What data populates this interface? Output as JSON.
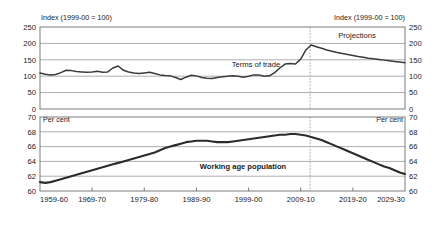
{
  "figure": {
    "background": "#ffffff",
    "line_color": "#3a3a3a",
    "grid_color": "#8c8c8c",
    "projection_divider_color": "#9a9a9a"
  },
  "chart_data": [
    {
      "type": "line",
      "id": "terms-of-trade",
      "title": "",
      "xlabel": "",
      "ylabel": "Index (1999-00 = 100)",
      "ylabel_right": "Index (1999-00 = 100)",
      "ylim": [
        0,
        250
      ],
      "yticks": [
        0,
        50,
        100,
        150,
        200,
        250
      ],
      "ytick_labels": [
        "0",
        "50",
        "100",
        "150",
        "200",
        "250"
      ],
      "xlim": [
        1959,
        2029
      ],
      "grid": true,
      "legend": "none",
      "annotations": [
        {
          "text": "Terms of trade",
          "x": 1993,
          "y": 128
        },
        {
          "text": "Projections",
          "x": 2019,
          "y": 222
        }
      ],
      "projection_start": 2011,
      "series": [
        {
          "name": "Terms of trade",
          "x": [
            1959,
            1960,
            1961,
            1962,
            1963,
            1964,
            1965,
            1966,
            1967,
            1968,
            1969,
            1970,
            1971,
            1972,
            1973,
            1974,
            1975,
            1976,
            1977,
            1978,
            1979,
            1980,
            1981,
            1982,
            1983,
            1984,
            1985,
            1986,
            1987,
            1988,
            1989,
            1990,
            1991,
            1992,
            1993,
            1994,
            1995,
            1996,
            1997,
            1998,
            1999,
            2000,
            2001,
            2002,
            2003,
            2004,
            2005,
            2006,
            2007,
            2008,
            2009,
            2010,
            2011,
            2012,
            2013,
            2014,
            2015,
            2016,
            2017,
            2018,
            2019,
            2020,
            2021,
            2022,
            2023,
            2024,
            2025,
            2026,
            2027,
            2028,
            2029
          ],
          "values": [
            110,
            106,
            104,
            105,
            111,
            118,
            117,
            114,
            113,
            112,
            113,
            115,
            112,
            113,
            125,
            131,
            118,
            113,
            110,
            108,
            110,
            112,
            108,
            104,
            102,
            101,
            96,
            90,
            97,
            103,
            101,
            96,
            94,
            93,
            96,
            98,
            100,
            101,
            100,
            97,
            100,
            104,
            104,
            100,
            101,
            111,
            125,
            137,
            139,
            137,
            152,
            180,
            195,
            190,
            185,
            180,
            176,
            172,
            169,
            166,
            163,
            160,
            158,
            155,
            153,
            151,
            149,
            147,
            145,
            143,
            141
          ]
        }
      ]
    },
    {
      "type": "line",
      "id": "working-age-population",
      "title": "",
      "xlabel": "",
      "ylabel": "Per cent",
      "ylabel_right": "Per cent",
      "ylim": [
        60,
        70
      ],
      "yticks": [
        60,
        62,
        64,
        66,
        68,
        70
      ],
      "ytick_labels": [
        "60",
        "62",
        "64",
        "66",
        "68",
        "70"
      ],
      "xlim": [
        1959,
        2029
      ],
      "xticks": [
        1959,
        1969,
        1979,
        1989,
        1999,
        2009,
        2019,
        2029
      ],
      "xtick_labels": [
        "1959-60",
        "1969-70",
        "1979-80",
        "1989-90",
        "1999-00",
        "2009-10",
        "2019-20",
        "2029-30"
      ],
      "grid": true,
      "legend": "none",
      "annotations": [
        {
          "text": "Working age population",
          "x": 1998,
          "y": 65.1,
          "bold": true
        }
      ],
      "projection_start": 2011,
      "series": [
        {
          "name": "Working age population",
          "x": [
            1959,
            1960,
            1961,
            1962,
            1963,
            1964,
            1965,
            1966,
            1967,
            1968,
            1969,
            1970,
            1971,
            1972,
            1973,
            1974,
            1975,
            1976,
            1977,
            1978,
            1979,
            1980,
            1981,
            1982,
            1983,
            1984,
            1985,
            1986,
            1987,
            1988,
            1989,
            1990,
            1991,
            1992,
            1993,
            1994,
            1995,
            1996,
            1997,
            1998,
            1999,
            2000,
            2001,
            2002,
            2003,
            2004,
            2005,
            2006,
            2007,
            2008,
            2009,
            2010,
            2011,
            2012,
            2013,
            2014,
            2015,
            2016,
            2017,
            2018,
            2019,
            2020,
            2021,
            2022,
            2023,
            2024,
            2025,
            2026,
            2027,
            2028,
            2029
          ],
          "values": [
            61.2,
            61.1,
            61.2,
            61.4,
            61.6,
            61.8,
            62.0,
            62.2,
            62.4,
            62.6,
            62.8,
            63.0,
            63.2,
            63.4,
            63.6,
            63.8,
            64.0,
            64.2,
            64.4,
            64.6,
            64.8,
            65.0,
            65.2,
            65.5,
            65.8,
            66.0,
            66.2,
            66.4,
            66.6,
            66.7,
            66.8,
            66.8,
            66.8,
            66.7,
            66.6,
            66.6,
            66.6,
            66.7,
            66.8,
            66.9,
            67.0,
            67.1,
            67.2,
            67.3,
            67.4,
            67.5,
            67.6,
            67.6,
            67.7,
            67.7,
            67.6,
            67.5,
            67.3,
            67.1,
            66.9,
            66.6,
            66.3,
            66.0,
            65.7,
            65.4,
            65.1,
            64.8,
            64.5,
            64.2,
            63.9,
            63.6,
            63.3,
            63.1,
            62.8,
            62.5,
            62.3
          ]
        }
      ]
    }
  ]
}
